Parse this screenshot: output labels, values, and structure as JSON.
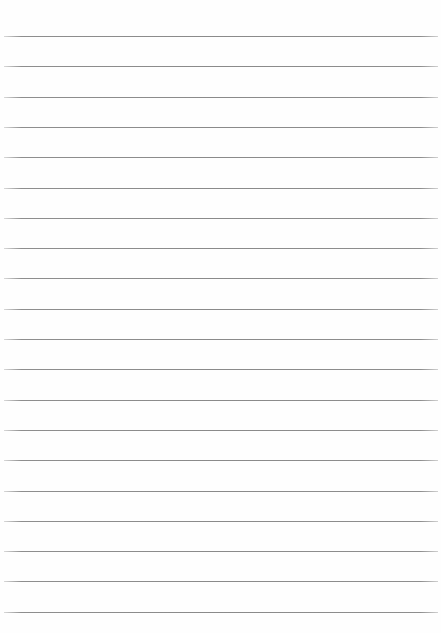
{
  "page": {
    "type": "lined-paper",
    "background": "#fefefe",
    "line_color": "#8a8a8a",
    "line_count": 20,
    "first_line_y": 36,
    "line_spacing": 30.3,
    "line_left": 4,
    "line_right": 438
  }
}
